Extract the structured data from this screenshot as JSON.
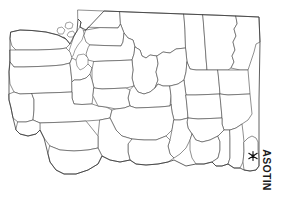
{
  "figure": {
    "kind": "county-outline-map",
    "state": "Washington",
    "background_color": "#ffffff",
    "boundary_color": "#4a4a4a",
    "label_color": "#1a1a1a",
    "width": 283,
    "height": 200
  },
  "highlight": {
    "county_label": "ASOTIN",
    "marker_glyph": "✱",
    "marker_name": "asterisk-marker",
    "marker_color": "#111111",
    "label_rotation_degrees": 90,
    "marker_position": {
      "x": 253,
      "y": 156
    }
  },
  "map": {
    "title": "",
    "counties_visible": 39,
    "notes": ""
  }
}
